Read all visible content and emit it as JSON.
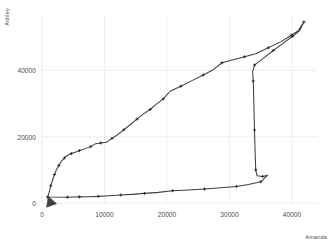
{
  "chart_data": {
    "type": "line",
    "title": "",
    "subtitle": "",
    "xlabel": "Amanda",
    "ylabel": "Ashley",
    "xlim": [
      0,
      44000
    ],
    "ylim": [
      0,
      57000
    ],
    "xticks": [
      0,
      10000,
      20000,
      30000,
      40000
    ],
    "xtick_labels": [
      "0",
      "10000",
      "20000",
      "30000",
      "40000"
    ],
    "yticks": [
      0,
      20000,
      40000
    ],
    "ytick_labels": [
      "0",
      "20000",
      "40000"
    ],
    "grid": true,
    "grid_color": "#e8e8e8",
    "legend": false,
    "legend_position": "none",
    "line_color": "#404040",
    "marker": "plus",
    "marker_color": "#2b2b2b",
    "annotations": [
      {
        "type": "arrowhead",
        "label": "direction-of-travel-arrow",
        "x": 1000,
        "y": 2000,
        "angle_deg": 250
      }
    ],
    "series": [
      {
        "name": "trajectory",
        "closed_loop": true,
        "points": [
          [
            900,
            1800
          ],
          [
            1100,
            3000
          ],
          [
            1400,
            5200
          ],
          [
            1700,
            7000
          ],
          [
            2000,
            8600
          ],
          [
            2300,
            10000
          ],
          [
            2700,
            11300
          ],
          [
            3100,
            12600
          ],
          [
            3600,
            13600
          ],
          [
            4100,
            14400
          ],
          [
            4700,
            14900
          ],
          [
            5300,
            15300
          ],
          [
            6000,
            15800
          ],
          [
            6900,
            16400
          ],
          [
            7800,
            17000
          ],
          [
            8600,
            17900
          ],
          [
            9400,
            18100
          ],
          [
            10300,
            18300
          ],
          [
            11200,
            19500
          ],
          [
            12100,
            20600
          ],
          [
            13100,
            22100
          ],
          [
            14100,
            23600
          ],
          [
            15200,
            25300
          ],
          [
            16200,
            26800
          ],
          [
            17300,
            28200
          ],
          [
            18300,
            29800
          ],
          [
            19400,
            31400
          ],
          [
            20500,
            33700
          ],
          [
            22200,
            35200
          ],
          [
            24000,
            36900
          ],
          [
            25800,
            38600
          ],
          [
            27400,
            40200
          ],
          [
            28800,
            42300
          ],
          [
            30600,
            43200
          ],
          [
            32400,
            44100
          ],
          [
            34200,
            45000
          ],
          [
            36200,
            46800
          ],
          [
            38200,
            48600
          ],
          [
            39900,
            50600
          ],
          [
            41000,
            52000
          ],
          [
            41900,
            54600
          ],
          [
            41200,
            51900
          ],
          [
            40100,
            50300
          ],
          [
            38600,
            48200
          ],
          [
            37000,
            46000
          ],
          [
            35400,
            43600
          ],
          [
            34000,
            41600
          ],
          [
            33700,
            39600
          ],
          [
            33800,
            36800
          ],
          [
            33900,
            30000
          ],
          [
            34000,
            22000
          ],
          [
            34100,
            15400
          ],
          [
            34200,
            10000
          ],
          [
            34400,
            8200
          ],
          [
            35300,
            8000
          ],
          [
            36100,
            8400
          ],
          [
            35000,
            6400
          ],
          [
            33000,
            5600
          ],
          [
            31100,
            5000
          ],
          [
            28600,
            4600
          ],
          [
            26000,
            4200
          ],
          [
            23400,
            3900
          ],
          [
            20900,
            3700
          ],
          [
            18600,
            3200
          ],
          [
            16400,
            2900
          ],
          [
            14400,
            2600
          ],
          [
            12600,
            2400
          ],
          [
            10800,
            2200
          ],
          [
            9000,
            2000
          ],
          [
            7400,
            1900
          ],
          [
            6000,
            1850
          ],
          [
            4900,
            1800
          ],
          [
            4100,
            1750
          ]
        ]
      }
    ]
  }
}
